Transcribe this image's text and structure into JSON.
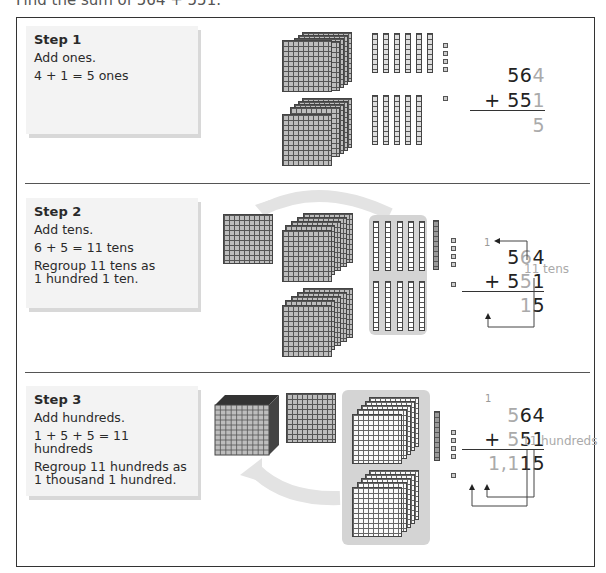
{
  "title": "Find the sum of 564 + 551.",
  "colors": {
    "frame": "#333333",
    "step_box": "#f3f3f3",
    "tray": "#d4d4d4",
    "highlight_digit": "#aaaaaa",
    "block": "#bdbdbd"
  },
  "steps": [
    {
      "heading": "Step 1",
      "lines": [
        "Add ones.",
        "4 + 1 = 5 ones"
      ],
      "addend1": {
        "plain": "56",
        "highlight": "4"
      },
      "addend2": {
        "sign": "+ ",
        "plain": "55",
        "highlight": "1"
      },
      "sum": {
        "highlight": "5"
      },
      "blocks": {
        "hundreds_top": 5,
        "tens_top": 6,
        "ones_top": 4,
        "hundreds_bottom": 5,
        "tens_bottom": 5,
        "ones_bottom": 1
      }
    },
    {
      "heading": "Step 2",
      "lines": [
        "Add tens.",
        "6 + 5 = 11 tens",
        "Regroup 11 tens as",
        "1 hundred 1 ten."
      ],
      "carry": "1",
      "addend1": {
        "a": "5",
        "highlight": "6",
        "b": "4"
      },
      "addend2": {
        "sign": "+ ",
        "a": "5",
        "highlight": "5",
        "b": "1"
      },
      "sum": {
        "highlight": "1",
        "plain": "5"
      },
      "label": "11 tens"
    },
    {
      "heading": "Step 3",
      "lines": [
        "Add hundreds.",
        "1 + 5 + 5 = 11 hundreds",
        "Regroup 11 hundreds as",
        "1 thousand 1 hundred."
      ],
      "carry": "1",
      "addend1": {
        "highlight": "5",
        "plain": "64"
      },
      "addend2": {
        "sign": "+ ",
        "highlight": "5",
        "plain": "51"
      },
      "sum": {
        "h1": "1",
        "comma": ",",
        "h2": "1",
        "plain": "15"
      },
      "label": "11 hundreds"
    }
  ]
}
